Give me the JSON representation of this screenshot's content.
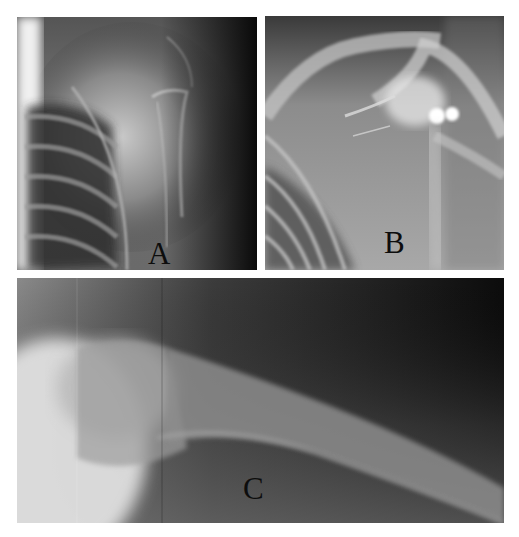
{
  "figure": {
    "panels": [
      {
        "id": "A",
        "label": "A",
        "description": "Shoulder radiograph, anteroposterior view, left side shows rib cage"
      },
      {
        "id": "B",
        "label": "B",
        "description": "Shoulder radiograph showing scapula, clavicle and humeral head with bright dense foci"
      },
      {
        "id": "C",
        "label": "C",
        "description": "Lateral radiograph of proximal humerus shaft extending to the right"
      }
    ]
  },
  "colors": {
    "background": "#ffffff",
    "label_text": "#0d0d0d"
  }
}
